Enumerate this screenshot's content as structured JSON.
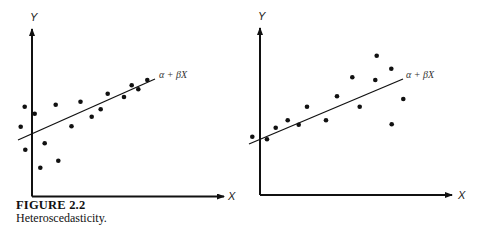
{
  "caption": {
    "figure_number": "FIGURE 2.2",
    "title": "Heteroscedasticity."
  },
  "chart_data": [
    {
      "type": "scatter",
      "title": "",
      "xlabel": "X",
      "ylabel": "Y",
      "line_label": "α + βX",
      "grid": false,
      "legend": "none",
      "description": "Scatter with fitted line; variance of Y around the line decreases as X increases",
      "points_px": [
        [
          20.7,
          126.7
        ],
        [
          24.7,
          106.7
        ],
        [
          25.3,
          149.7
        ],
        [
          34.7,
          113.7
        ],
        [
          40.3,
          167.7
        ],
        [
          44.7,
          143.3
        ],
        [
          55.7,
          104.7
        ],
        [
          58.3,
          160.7
        ],
        [
          71.5,
          126.2
        ],
        [
          80.5,
          101.7
        ],
        [
          91.7,
          116.7
        ],
        [
          100.7,
          109.3
        ],
        [
          107.7,
          93.7
        ],
        [
          124,
          97
        ],
        [
          131.7,
          85.3
        ],
        [
          138.3,
          89.3
        ],
        [
          147.3,
          80
        ]
      ],
      "fit_line_px": [
        [
          18,
          140
        ],
        [
          155,
          79
        ]
      ]
    },
    {
      "type": "scatter",
      "title": "",
      "xlabel": "X",
      "ylabel": "Y",
      "line_label": "α + βX",
      "grid": false,
      "legend": "none",
      "description": "Scatter with fitted line; variance of Y around the line increases as X increases",
      "points_px": [
        [
          252.3,
          136.7
        ],
        [
          267,
          139.3
        ],
        [
          275.7,
          127.7
        ],
        [
          287.7,
          120.3
        ],
        [
          298.7,
          124.7
        ],
        [
          307,
          106.7
        ],
        [
          326,
          120.3
        ],
        [
          337,
          96.3
        ],
        [
          352.3,
          77.3
        ],
        [
          359.7,
          106.7
        ],
        [
          375.3,
          80
        ],
        [
          376.7,
          55.7
        ],
        [
          391.3,
          68.7
        ],
        [
          391.7,
          124.3
        ],
        [
          403.3,
          99
        ]
      ],
      "fit_line_px": [
        [
          249,
          144
        ],
        [
          403,
          79
        ]
      ]
    }
  ]
}
